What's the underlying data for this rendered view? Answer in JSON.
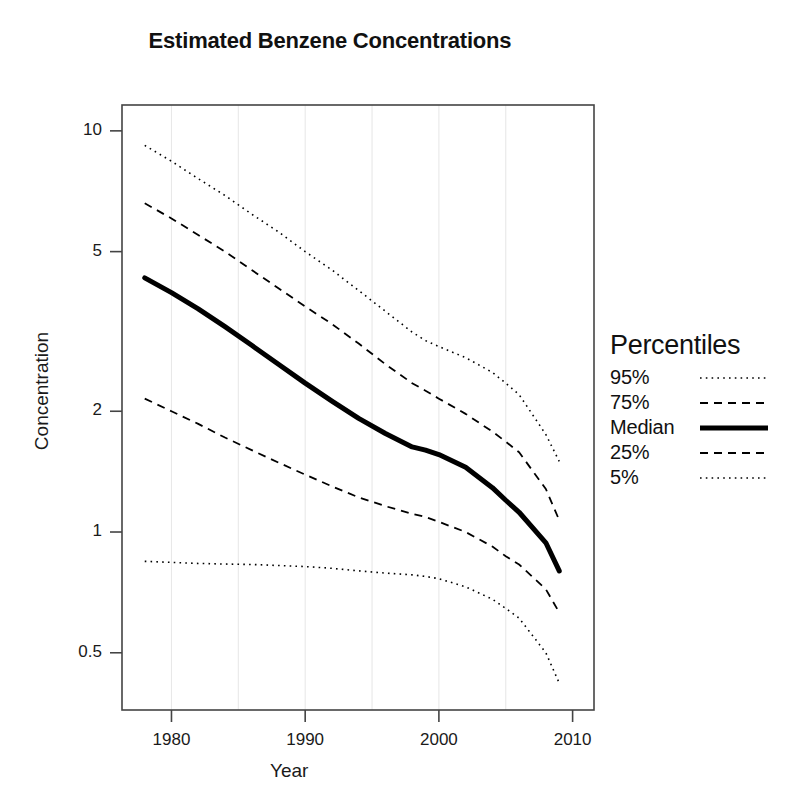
{
  "chart_data": {
    "type": "line",
    "title": "Estimated Benzene Concentrations",
    "xlabel": "Year",
    "ylabel": "Concentration",
    "xlim": [
      1976.3,
      2011.6
    ],
    "ylim": [
      0.36,
      11.6
    ],
    "yscale": "log",
    "xticks": [
      1980,
      1990,
      2000,
      2010
    ],
    "xtick_labels": [
      "1980",
      "1990",
      "2000",
      "2010"
    ],
    "yticks": [
      0.5,
      1,
      2,
      5,
      10
    ],
    "ytick_labels": [
      "0.5",
      "1",
      "2",
      "5",
      "10"
    ],
    "gridlines_x": [
      1980,
      1985,
      1990,
      1995,
      2000,
      2005
    ],
    "grid": "vertical-only",
    "legend_title": "Percentiles",
    "legend_position": "right",
    "x": [
      1978,
      1980,
      1982,
      1984,
      1986,
      1988,
      1990,
      1992,
      1994,
      1996,
      1998,
      1999,
      2000,
      2002,
      2004,
      2005,
      2006,
      2008,
      2009
    ],
    "series": [
      {
        "name": "95%",
        "style": "dotted",
        "values": [
          9.2,
          8.4,
          7.6,
          6.9,
          6.2,
          5.6,
          5.0,
          4.5,
          4.0,
          3.55,
          3.15,
          3.0,
          2.9,
          2.72,
          2.5,
          2.35,
          2.2,
          1.75,
          1.5
        ]
      },
      {
        "name": "75%",
        "style": "dashed",
        "values": [
          6.6,
          6.05,
          5.5,
          5.0,
          4.5,
          4.05,
          3.65,
          3.3,
          2.95,
          2.62,
          2.35,
          2.25,
          2.15,
          1.97,
          1.78,
          1.68,
          1.58,
          1.28,
          1.07
        ]
      },
      {
        "name": "Median",
        "style": "solid",
        "values": [
          4.3,
          3.95,
          3.6,
          3.25,
          2.92,
          2.62,
          2.35,
          2.12,
          1.92,
          1.76,
          1.63,
          1.6,
          1.56,
          1.45,
          1.29,
          1.2,
          1.12,
          0.94,
          0.8
        ]
      },
      {
        "name": "25%",
        "style": "dashed",
        "values": [
          2.15,
          2.0,
          1.86,
          1.72,
          1.6,
          1.49,
          1.39,
          1.3,
          1.22,
          1.16,
          1.11,
          1.09,
          1.06,
          1.0,
          0.92,
          0.87,
          0.83,
          0.72,
          0.63
        ]
      },
      {
        "name": "5%",
        "style": "dotted",
        "values": [
          0.845,
          0.84,
          0.835,
          0.832,
          0.83,
          0.825,
          0.82,
          0.812,
          0.8,
          0.79,
          0.782,
          0.775,
          0.765,
          0.73,
          0.68,
          0.645,
          0.61,
          0.5,
          0.42
        ]
      }
    ]
  },
  "legend": {
    "title": "Percentiles",
    "items": [
      {
        "label": "95%",
        "style": "dotted"
      },
      {
        "label": "75%",
        "style": "dashed"
      },
      {
        "label": "Median",
        "style": "solid"
      },
      {
        "label": "25%",
        "style": "dashed"
      },
      {
        "label": "5%",
        "style": "dotted"
      }
    ]
  },
  "colors": {
    "line": "#000000",
    "grid": "#e8e8e8",
    "axis": "#444444",
    "text": "#111111"
  }
}
